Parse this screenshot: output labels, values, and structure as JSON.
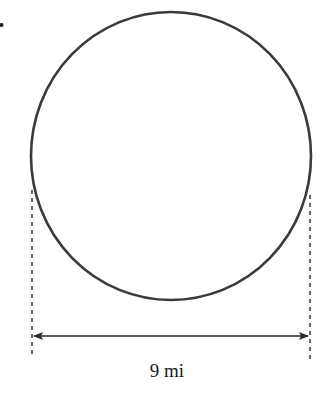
{
  "figure": {
    "type": "circle-diagram",
    "shape": "circle",
    "measurement": {
      "label": "9 mi",
      "value": 9,
      "unit": "mi",
      "dimension": "diameter"
    },
    "colors": {
      "stroke": "#3a3a3a",
      "dashed": "#2a2a2a",
      "arrow": "#2a2a2a",
      "text": "#1a1a1a",
      "background": "#ffffff"
    },
    "geometry": {
      "circle": {
        "cx": 171,
        "cy": 156,
        "rx": 140,
        "ry": 144
      },
      "left_guide_x": 32,
      "right_guide_x": 310,
      "arrow_y": 336
    },
    "list_marker": "•"
  }
}
